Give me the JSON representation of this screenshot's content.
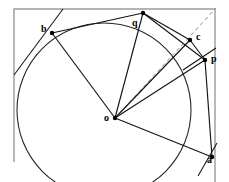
{
  "figure": {
    "width": 229,
    "height": 182,
    "background_color": "#ffffff",
    "stroke_color": "#1a1a1a",
    "frame_color": "#9a9a9a",
    "dashed_color": "#8a8a8a"
  },
  "points": {
    "o": {
      "label": "o",
      "x": 115,
      "y": 118,
      "label_x": 104,
      "label_y": 113
    },
    "a": {
      "label": "a",
      "x": 212,
      "y": 157,
      "label_x": 207,
      "label_y": 157
    },
    "b": {
      "label": "b",
      "x": 52,
      "y": 33,
      "label_x": 41,
      "label_y": 24
    },
    "c": {
      "label": "c",
      "x": 190,
      "y": 40,
      "label_x": 196,
      "label_y": 32
    },
    "p": {
      "label": "p",
      "x": 205,
      "y": 60,
      "label_x": 211,
      "label_y": 54
    },
    "q": {
      "label": "q",
      "x": 143,
      "y": 13,
      "label_x": 132,
      "label_y": 18
    }
  },
  "circle": {
    "center_x": 104,
    "center_y": 110,
    "radius": 87,
    "description": "main circle through b, q, c, p, a"
  },
  "frame": {
    "left": 14,
    "top": 9,
    "right": 215,
    "bottom": 182,
    "description": "partial rectangle frame, bottom edge off-screen"
  },
  "segments": [
    {
      "name": "o-to-b",
      "from": "o",
      "to": "b"
    },
    {
      "name": "o-to-q",
      "from": "o",
      "to": "q"
    },
    {
      "name": "o-to-c",
      "from": "o",
      "to": "c"
    },
    {
      "name": "o-to-p",
      "from": "o",
      "to": "p"
    },
    {
      "name": "o-to-a",
      "from": "o",
      "to": "a"
    },
    {
      "name": "b-to-q",
      "from": "b",
      "to": "q"
    },
    {
      "name": "q-to-c",
      "from": "q",
      "to": "c"
    },
    {
      "name": "c-to-p",
      "from": "c",
      "to": "p"
    },
    {
      "name": "p-to-a",
      "from": "p",
      "to": "a"
    }
  ],
  "dashed_segments": [
    {
      "name": "o-to-corner-ray",
      "description": "dashed ray from o through c to top-right corner"
    }
  ],
  "labels_order": [
    "b",
    "q",
    "c",
    "p",
    "o",
    "a"
  ]
}
